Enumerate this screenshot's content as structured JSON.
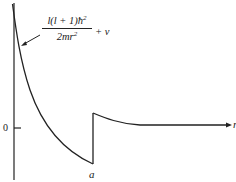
{
  "diagram": {
    "type": "effective-potential-plot",
    "colors": {
      "line": "#222222",
      "background": "#ffffff",
      "text": "#1a1a1a"
    },
    "axes": {
      "y_tick_label": "0",
      "x_axis_label": "r",
      "x_marker_label": "a"
    },
    "annotation": {
      "numerator": "l(l + 1)ħ",
      "numerator_exp": "2",
      "denominator": "2mr",
      "denominator_exp": "2",
      "suffix": "+ v"
    }
  }
}
